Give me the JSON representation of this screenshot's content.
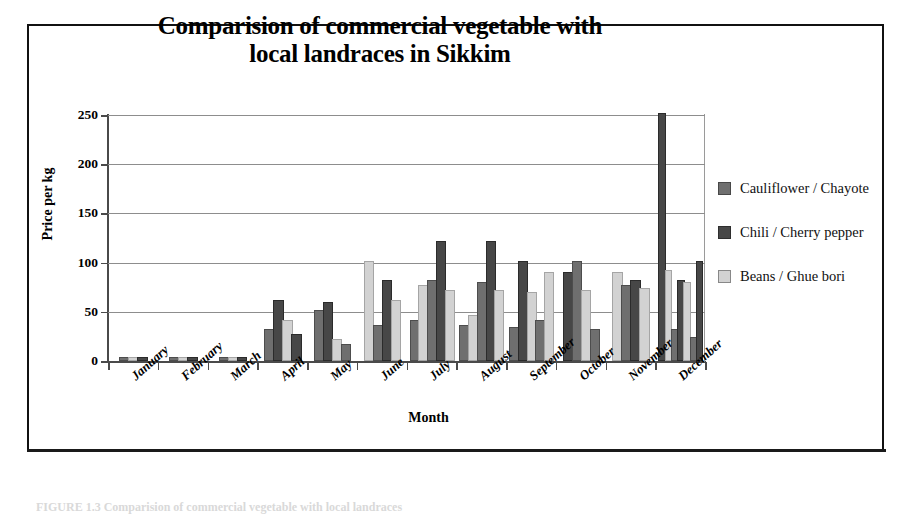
{
  "figure": {
    "caption": "FIGURE 1.3   Comparision of commercial vegetable with local landraces"
  },
  "chart_data": {
    "type": "bar",
    "title": "Comparision of commercial vegetable with local landraces in Sikkim",
    "title_line1": "Comparision of commercial vegetable with",
    "title_line2": "local landraces in Sikkim",
    "xlabel": "Month",
    "ylabel": "Price per kg",
    "ylim": [
      0,
      250
    ],
    "yticks": [
      0,
      50,
      100,
      150,
      200,
      250
    ],
    "ytick_labels": [
      "0",
      "50",
      "100",
      "150",
      "200",
      "250"
    ],
    "grid": true,
    "legend_position": "right",
    "categories": [
      "January",
      "February",
      "March",
      "April",
      "May",
      "June",
      "July",
      "August",
      "September",
      "October",
      "November",
      "December"
    ],
    "series": [
      {
        "name": "Cauliflower / Chayote",
        "color": "#6f6f6f",
        "values": [
          2,
          2,
          2,
          30,
          50,
          35,
          80,
          78,
          100,
          88,
          30,
          30
        ]
      },
      {
        "name": "Chili / Cherry pepper",
        "color": "#474747",
        "values": [
          2,
          2,
          2,
          60,
          58,
          80,
          120,
          120,
          120,
          100,
          75,
          250
        ]
      },
      {
        "name": "Beans / Ghue bori",
        "color": "#d2d2d2",
        "values": [
          2,
          2,
          2,
          40,
          20,
          100,
          70,
          70,
          68,
          70,
          88,
          90
        ]
      }
    ],
    "extra_bars": {
      "note": "Within several month groups additional paired bars are drawn",
      "groups": [
        {
          "month": "April",
          "bars": []
        },
        {
          "month": "May",
          "bars": [
            {
              "series": 1,
              "value": 25
            }
          ]
        },
        {
          "month": "June",
          "bars": [
            {
              "series": 2,
              "value": 60
            }
          ]
        },
        {
          "month": "July",
          "bars": [
            {
              "series": 0,
              "value": 40
            },
            {
              "series": 2,
              "value": 45
            }
          ]
        },
        {
          "month": "August",
          "bars": [
            {
              "series": 0,
              "value": 35
            },
            {
              "series": 2,
              "value": 45
            }
          ]
        },
        {
          "month": "September",
          "bars": [
            {
              "series": 0,
              "value": 33
            },
            {
              "series": 2,
              "value": 88
            }
          ]
        },
        {
          "month": "October",
          "bars": [
            {
              "series": 0,
              "value": 30
            },
            {
              "series": 2,
              "value": 75
            }
          ]
        },
        {
          "month": "November",
          "bars": [
            {
              "series": 0,
              "value": 40
            },
            {
              "series": 2,
              "value": 90
            }
          ]
        },
        {
          "month": "December",
          "bars": [
            {
              "series": 0,
              "value": 22
            },
            {
              "series": 2,
              "value": 80
            }
          ]
        }
      ]
    },
    "bar_layout": [
      {
        "month": "January",
        "bars": [
          {
            "s": 0,
            "v": 2
          },
          {
            "s": 2,
            "v": 2
          },
          {
            "s": 1,
            "v": 2
          }
        ]
      },
      {
        "month": "February",
        "bars": [
          {
            "s": 0,
            "v": 2
          },
          {
            "s": 2,
            "v": 2
          },
          {
            "s": 1,
            "v": 2
          }
        ]
      },
      {
        "month": "March",
        "bars": [
          {
            "s": 0,
            "v": 2
          },
          {
            "s": 2,
            "v": 2
          },
          {
            "s": 1,
            "v": 2
          }
        ]
      },
      {
        "month": "April",
        "bars": [
          {
            "s": 0,
            "v": 30
          },
          {
            "s": 1,
            "v": 60
          },
          {
            "s": 2,
            "v": 40
          },
          {
            "s": 1,
            "v": 25
          }
        ]
      },
      {
        "month": "May",
        "bars": [
          {
            "s": 0,
            "v": 50
          },
          {
            "s": 1,
            "v": 58
          },
          {
            "s": 2,
            "v": 20
          },
          {
            "s": 0,
            "v": 15
          }
        ]
      },
      {
        "month": "June",
        "bars": [
          {
            "s": 2,
            "v": 100
          },
          {
            "s": 0,
            "v": 35
          },
          {
            "s": 1,
            "v": 80
          },
          {
            "s": 2,
            "v": 60
          }
        ]
      },
      {
        "month": "July",
        "bars": [
          {
            "s": 0,
            "v": 40
          },
          {
            "s": 2,
            "v": 75
          },
          {
            "s": 0,
            "v": 80
          },
          {
            "s": 1,
            "v": 120
          },
          {
            "s": 2,
            "v": 70
          }
        ]
      },
      {
        "month": "August",
        "bars": [
          {
            "s": 0,
            "v": 35
          },
          {
            "s": 2,
            "v": 45
          },
          {
            "s": 0,
            "v": 78
          },
          {
            "s": 1,
            "v": 120
          },
          {
            "s": 2,
            "v": 70
          }
        ]
      },
      {
        "month": "September",
        "bars": [
          {
            "s": 0,
            "v": 33
          },
          {
            "s": 1,
            "v": 100
          },
          {
            "s": 2,
            "v": 68
          },
          {
            "s": 0,
            "v": 40
          },
          {
            "s": 2,
            "v": 88
          }
        ]
      },
      {
        "month": "October",
        "bars": [
          {
            "s": 1,
            "v": 88
          },
          {
            "s": 0,
            "v": 100
          },
          {
            "s": 2,
            "v": 70
          },
          {
            "s": 0,
            "v": 30
          }
        ]
      },
      {
        "month": "November",
        "bars": [
          {
            "s": 2,
            "v": 88
          },
          {
            "s": 0,
            "v": 75
          },
          {
            "s": 1,
            "v": 80
          },
          {
            "s": 2,
            "v": 72
          }
        ]
      },
      {
        "month": "December",
        "bars": [
          {
            "s": 1,
            "v": 250
          },
          {
            "s": 2,
            "v": 90
          },
          {
            "s": 0,
            "v": 30
          },
          {
            "s": 1,
            "v": 80
          },
          {
            "s": 2,
            "v": 78
          },
          {
            "s": 0,
            "v": 22
          },
          {
            "s": 1,
            "v": 100
          }
        ]
      }
    ]
  },
  "legend": {
    "items": [
      {
        "label": "Cauliflower / Chayote",
        "color": "#6f6f6f"
      },
      {
        "label": "Chili / Cherry pepper",
        "color": "#474747"
      },
      {
        "label": "Beans / Ghue bori",
        "color": "#d2d2d2"
      }
    ]
  }
}
